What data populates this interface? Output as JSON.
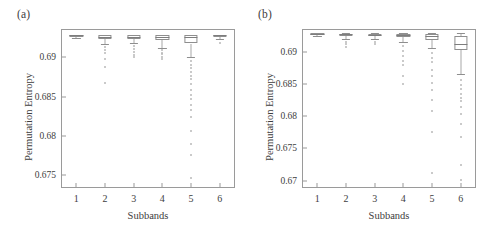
{
  "figure": {
    "width": 483,
    "height": 233,
    "background": "#ffffff",
    "line_color": "#9a9a9a",
    "text_color": "#3d3d3d",
    "outlier_color": "#b9b9b9"
  },
  "panels": [
    {
      "key": "a",
      "label": "(a)",
      "xlabel": "Subbands",
      "ylabel": "Permutation Entropy",
      "xticklabels": [
        "1",
        "2",
        "3",
        "4",
        "5",
        "6"
      ],
      "yticklabels": [
        "0.675",
        "0.68",
        "0.685",
        "0.69"
      ],
      "yticks": [
        0.675,
        0.68,
        0.685,
        0.69
      ]
    },
    {
      "key": "b",
      "label": "(b)",
      "xlabel": "Subbands",
      "ylabel": "Permutation Entropy",
      "xticklabels": [
        "1",
        "2",
        "3",
        "4",
        "5",
        "6"
      ],
      "yticklabels": [
        "0.67",
        "0.675",
        "0.68",
        "0.685",
        "0.69"
      ],
      "yticks": [
        0.67,
        0.675,
        0.68,
        0.685,
        0.69
      ]
    }
  ],
  "chart_data": [
    {
      "type": "box",
      "panel": "a",
      "title": "(a)",
      "xlabel": "Subbands",
      "ylabel": "Permutation Entropy",
      "categories": [
        "1",
        "2",
        "3",
        "4",
        "5",
        "6"
      ],
      "ylim": [
        0.6735,
        0.6935
      ],
      "yticks": [
        0.675,
        0.68,
        0.685,
        0.69
      ],
      "grid": false,
      "legend": null,
      "boxes": [
        {
          "category": "1",
          "q1": 0.69268,
          "median": 0.6928,
          "q3": 0.69288,
          "whisker_low": 0.6925,
          "whisker_high": 0.69292,
          "outliers": []
        },
        {
          "category": "2",
          "q1": 0.69235,
          "median": 0.69262,
          "q3": 0.69281,
          "whisker_low": 0.6917,
          "whisker_high": 0.69292,
          "outliers": [
            0.6913,
            0.69095,
            0.6906,
            0.68985,
            0.6888,
            0.6868
          ]
        },
        {
          "category": "3",
          "q1": 0.69238,
          "median": 0.69265,
          "q3": 0.69282,
          "whisker_low": 0.6918,
          "whisker_high": 0.69292,
          "outliers": [
            0.6914,
            0.6911,
            0.69075,
            0.69035,
            0.69005
          ]
        },
        {
          "category": "4",
          "q1": 0.69225,
          "median": 0.69258,
          "q3": 0.6928,
          "whisker_low": 0.69125,
          "whisker_high": 0.69292,
          "outliers": [
            0.6909,
            0.69062,
            0.6904,
            0.69012,
            0.68985
          ]
        },
        {
          "category": "5",
          "q1": 0.69178,
          "median": 0.69262,
          "q3": 0.69286,
          "whisker_low": 0.6901,
          "whisker_high": 0.69292,
          "outliers": [
            0.6896,
            0.68905,
            0.6886,
            0.6881,
            0.6877,
            0.6872,
            0.6866,
            0.6859,
            0.6852,
            0.6847,
            0.684,
            0.6833,
            0.6824,
            0.6806,
            0.679,
            0.6776,
            0.6746
          ]
        },
        {
          "category": "6",
          "q1": 0.69272,
          "median": 0.69282,
          "q3": 0.69289,
          "whisker_low": 0.69235,
          "whisker_high": 0.69292,
          "outliers": [
            0.6919
          ]
        }
      ]
    },
    {
      "type": "box",
      "panel": "b",
      "title": "(b)",
      "xlabel": "Subbands",
      "ylabel": "Permutation Entropy",
      "categories": [
        "1",
        "2",
        "3",
        "4",
        "5",
        "6"
      ],
      "ylim": [
        0.669,
        0.6934
      ],
      "yticks": [
        0.67,
        0.675,
        0.68,
        0.685,
        0.69
      ],
      "grid": false,
      "legend": null,
      "boxes": [
        {
          "category": "1",
          "q1": 0.6927,
          "median": 0.6928,
          "q3": 0.69288,
          "whisker_low": 0.69252,
          "whisker_high": 0.69293,
          "outliers": []
        },
        {
          "category": "2",
          "q1": 0.6925,
          "median": 0.69272,
          "q3": 0.69285,
          "whisker_low": 0.692,
          "whisker_high": 0.69293,
          "outliers": [
            0.6916,
            0.69115,
            0.6907
          ]
        },
        {
          "category": "3",
          "q1": 0.69248,
          "median": 0.6927,
          "q3": 0.69284,
          "whisker_low": 0.69195,
          "whisker_high": 0.69293,
          "outliers": [
            0.6915,
            0.6912
          ]
        },
        {
          "category": "4",
          "q1": 0.69232,
          "median": 0.69262,
          "q3": 0.69282,
          "whisker_low": 0.6916,
          "whisker_high": 0.69293,
          "outliers": [
            0.69095,
            0.6902,
            0.6893,
            0.6886,
            0.688,
            0.6862,
            0.685
          ]
        },
        {
          "category": "5",
          "q1": 0.69192,
          "median": 0.6925,
          "q3": 0.69282,
          "whisker_low": 0.69055,
          "whisker_high": 0.69293,
          "outliers": [
            0.6898,
            0.689,
            0.6884,
            0.6872,
            0.6862,
            0.6852,
            0.684,
            0.6825,
            0.6808,
            0.6776,
            0.6712
          ]
        },
        {
          "category": "6",
          "q1": 0.6903,
          "median": 0.6913,
          "q3": 0.69245,
          "whisker_low": 0.6866,
          "whisker_high": 0.6929,
          "outliers": [
            0.6856,
            0.6848,
            0.6842,
            0.6835,
            0.6829,
            0.6823,
            0.6815,
            0.6803,
            0.6788,
            0.6768,
            0.6724,
            0.6701
          ]
        }
      ]
    }
  ]
}
